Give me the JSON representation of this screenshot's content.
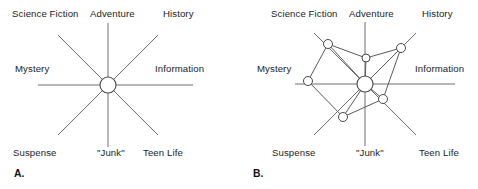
{
  "figure": {
    "width": 478,
    "height": 189,
    "background_color": "#ffffff",
    "line_color": "#6f6f6f",
    "node_fill_color": "#ffffff",
    "node_stroke_color": "#4a4a4a",
    "text_color": "#1c1c1c"
  },
  "panels": [
    {
      "id": "panel-a",
      "caption": "A.",
      "caption_pos": {
        "x": 14,
        "y": 168
      },
      "center": {
        "x": 108,
        "y": 85
      },
      "hub_radius": 8,
      "axes": [
        {
          "name": "science-fiction",
          "label": "Science Fiction",
          "angle_deg": 135,
          "length": 70,
          "label_pos": {
            "x": 12,
            "y": 9
          }
        },
        {
          "name": "adventure",
          "label": "Adventure",
          "angle_deg": 90,
          "length": 62,
          "label_pos": {
            "x": 90,
            "y": 9
          }
        },
        {
          "name": "history",
          "label": "History",
          "angle_deg": 45,
          "length": 70,
          "label_pos": {
            "x": 163,
            "y": 9
          }
        },
        {
          "name": "mystery",
          "label": "Mystery",
          "angle_deg": 180,
          "length": 70,
          "label_pos": {
            "x": 15,
            "y": 64
          }
        },
        {
          "name": "information",
          "label": "Information",
          "angle_deg": 0,
          "length": 85,
          "label_pos": {
            "x": 155,
            "y": 64
          }
        },
        {
          "name": "suspense",
          "label": "Suspense",
          "angle_deg": 225,
          "length": 70,
          "label_pos": {
            "x": 13,
            "y": 148
          }
        },
        {
          "name": "junk",
          "label": "\"Junk\"",
          "angle_deg": 270,
          "length": 62,
          "label_pos": {
            "x": 97,
            "y": 148
          }
        },
        {
          "name": "teen-life",
          "label": "Teen Life",
          "angle_deg": 315,
          "length": 70,
          "label_pos": {
            "x": 143,
            "y": 148
          }
        }
      ],
      "nodes": [],
      "edges": []
    },
    {
      "id": "panel-b",
      "caption": "B.",
      "caption_pos": {
        "x": 14,
        "y": 168
      },
      "center": {
        "x": 126,
        "y": 84
      },
      "hub_radius": 8,
      "axes": [
        {
          "name": "science-fiction",
          "label": "Science Fiction",
          "angle_deg": 135,
          "length": 72,
          "label_pos": {
            "x": 32,
            "y": 9
          }
        },
        {
          "name": "adventure",
          "label": "Adventure",
          "angle_deg": 90,
          "length": 62,
          "label_pos": {
            "x": 110,
            "y": 9
          }
        },
        {
          "name": "history",
          "label": "History",
          "angle_deg": 45,
          "length": 72,
          "label_pos": {
            "x": 183,
            "y": 9
          }
        },
        {
          "name": "mystery",
          "label": "Mystery",
          "angle_deg": 180,
          "length": 70,
          "label_pos": {
            "x": 18,
            "y": 64
          }
        },
        {
          "name": "information",
          "label": "Information",
          "angle_deg": 0,
          "length": 90,
          "label_pos": {
            "x": 176,
            "y": 64
          }
        },
        {
          "name": "suspense",
          "label": "Suspense",
          "angle_deg": 225,
          "length": 72,
          "label_pos": {
            "x": 33,
            "y": 148
          }
        },
        {
          "name": "junk",
          "label": "\"Junk\"",
          "angle_deg": 270,
          "length": 62,
          "label_pos": {
            "x": 117,
            "y": 148
          }
        },
        {
          "name": "teen-life",
          "label": "Teen Life",
          "angle_deg": 315,
          "length": 72,
          "label_pos": {
            "x": 180,
            "y": 148
          }
        }
      ],
      "nodes": [
        {
          "name": "node-hub",
          "axis": "center",
          "x": 126,
          "y": 84,
          "r": 8
        },
        {
          "name": "node-science-fiction",
          "axis": "science-fiction",
          "x": 89,
          "y": 44,
          "r": 4.5
        },
        {
          "name": "node-adventure",
          "axis": "adventure",
          "x": 127,
          "y": 58,
          "r": 4
        },
        {
          "name": "node-history",
          "axis": "history",
          "x": 162,
          "y": 48,
          "r": 4.5
        },
        {
          "name": "node-mystery",
          "axis": "mystery",
          "x": 69,
          "y": 81,
          "r": 4.5
        },
        {
          "name": "node-junk",
          "axis": "junk",
          "x": 104,
          "y": 117,
          "r": 4.5
        },
        {
          "name": "node-teen-life",
          "axis": "teen-life",
          "x": 144,
          "y": 99,
          "r": 4.5
        }
      ],
      "edges": [
        {
          "from": "node-science-fiction",
          "to": "node-adventure"
        },
        {
          "from": "node-adventure",
          "to": "node-history"
        },
        {
          "from": "node-science-fiction",
          "to": "node-mystery"
        },
        {
          "from": "node-science-fiction",
          "to": "node-hub"
        },
        {
          "from": "node-mystery",
          "to": "node-junk"
        },
        {
          "from": "node-junk",
          "to": "node-hub"
        },
        {
          "from": "node-junk",
          "to": "node-teen-life"
        },
        {
          "from": "node-teen-life",
          "to": "node-history"
        },
        {
          "from": "node-teen-life",
          "to": "node-hub"
        },
        {
          "from": "node-history",
          "to": "node-hub"
        },
        {
          "from": "node-adventure",
          "to": "node-hub"
        }
      ]
    }
  ]
}
